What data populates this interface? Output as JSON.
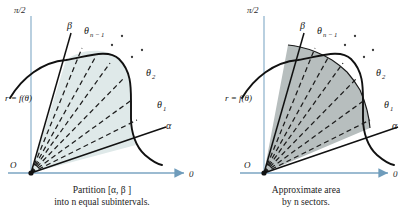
{
  "figure": {
    "title_present": false,
    "background_color": "#ffffff",
    "axis_color": "#93b6cf",
    "curve_color": "#111111",
    "ray_color": "#1a1a1a",
    "panels": [
      {
        "id": "left",
        "fill_color": "#dfe9e9",
        "fill_label": "pale blue-green tint",
        "axes": {
          "y_label": "π/2",
          "x_label": "0",
          "origin_label": "O"
        },
        "curve_label": "r = f(θ)",
        "rays": [
          {
            "name": "alpha",
            "label": "α",
            "sub": "",
            "style": "solid"
          },
          {
            "name": "theta-1",
            "label": "θ",
            "sub": "1",
            "style": "dashed"
          },
          {
            "name": "theta-2",
            "label": "θ",
            "sub": "2",
            "style": "dashed"
          },
          {
            "name": "theta-n-minus-1",
            "label": "θ",
            "sub": "n − 1",
            "style": "dashed"
          },
          {
            "name": "beta",
            "label": "β",
            "sub": "",
            "style": "solid"
          }
        ],
        "ellipsis": "⋰",
        "caption_lines": [
          "Partition [α, β ]",
          "into n equal subintervals."
        ]
      },
      {
        "id": "right",
        "fill_color": "#b7bebe",
        "fill_label": "gray sector fill",
        "axes": {
          "y_label": "π/2",
          "x_label": "0",
          "origin_label": "O"
        },
        "curve_label": "r = f(θ)",
        "rays": [
          {
            "name": "alpha",
            "label": "α",
            "sub": "",
            "style": "solid"
          },
          {
            "name": "theta-1",
            "label": "θ",
            "sub": "1",
            "style": "dashed"
          },
          {
            "name": "theta-2",
            "label": "θ",
            "sub": "2",
            "style": "dashed"
          },
          {
            "name": "theta-n-minus-1",
            "label": "θ",
            "sub": "n − 1",
            "style": "dashed"
          },
          {
            "name": "beta",
            "label": "β",
            "sub": "",
            "style": "solid"
          }
        ],
        "ellipsis": "⋰",
        "caption_lines": [
          "Approximate area",
          "by n sectors."
        ]
      }
    ]
  }
}
